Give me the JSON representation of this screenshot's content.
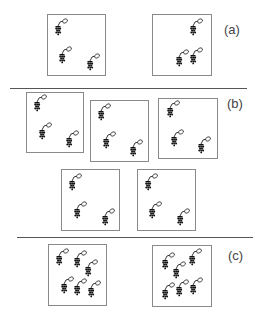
{
  "panels": [
    {
      "label": "(a)",
      "label_pos": [
        224,
        22
      ],
      "boxes": [
        {
          "rect": [
            47,
            14,
            59,
            62
          ],
          "grapes": [
            [
              58,
              29
            ],
            [
              62,
              57
            ],
            [
              90,
              64
            ]
          ]
        },
        {
          "rect": [
            152,
            14,
            60,
            62
          ],
          "grapes": [
            [
              193,
              29
            ],
            [
              179,
              60
            ],
            [
              193,
              58
            ]
          ]
        }
      ]
    },
    {
      "label": "(b)",
      "label_pos": [
        227,
        96
      ],
      "boxes": [
        {
          "rect": [
            26,
            92,
            58,
            61
          ],
          "grapes": [
            [
              37,
              105
            ],
            [
              42,
              133
            ],
            [
              69,
              141
            ]
          ]
        },
        {
          "rect": [
            90,
            100,
            59,
            62
          ],
          "grapes": [
            [
              101,
              114
            ],
            [
              106,
              142
            ],
            [
              133,
              150
            ]
          ]
        },
        {
          "rect": [
            158,
            98,
            60,
            61
          ],
          "grapes": [
            [
              170,
              111
            ],
            [
              174,
              140
            ],
            [
              201,
              147
            ]
          ]
        }
      ]
    },
    {
      "label": null,
      "boxes": [
        {
          "rect": [
            61,
            169,
            59,
            62
          ],
          "grapes": [
            [
              72,
              184
            ],
            [
              77,
              212
            ],
            [
              105,
              219
            ]
          ]
        },
        {
          "rect": [
            137,
            169,
            59,
            62
          ],
          "grapes": [
            [
              148,
              184
            ],
            [
              152,
              212
            ],
            [
              180,
              219
            ]
          ]
        }
      ]
    },
    {
      "label": "(c)",
      "label_pos": [
        228,
        248
      ],
      "boxes": [
        {
          "rect": [
            48,
            244,
            59,
            62
          ],
          "grapes": [
            [
              59,
              259
            ],
            [
              77,
              261
            ],
            [
              88,
              270
            ],
            [
              64,
              287
            ],
            [
              77,
              289
            ],
            [
              91,
              291
            ]
          ]
        },
        {
          "rect": [
            152,
            245,
            60,
            62
          ],
          "grapes": [
            [
              165,
              263
            ],
            [
              192,
              259
            ],
            [
              176,
              272
            ],
            [
              165,
              293
            ],
            [
              179,
              290
            ],
            [
              193,
              288
            ]
          ]
        }
      ]
    }
  ],
  "separators": [
    {
      "y": 88,
      "x1": 10,
      "x2": 247
    },
    {
      "y": 237,
      "x1": 17,
      "x2": 253
    }
  ],
  "icon": "grape-cluster-icon"
}
